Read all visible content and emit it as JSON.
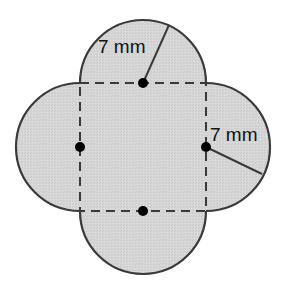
{
  "diagram": {
    "type": "composite-shape",
    "labels": {
      "top_radius": "7 mm",
      "right_radius": "7 mm"
    },
    "radius_mm": 7,
    "colors": {
      "fill": "#d4d4d4",
      "stroke": "#3a3a3a",
      "dashed": "#3a3a3a",
      "dot": "#000000",
      "background": "#ffffff"
    }
  }
}
